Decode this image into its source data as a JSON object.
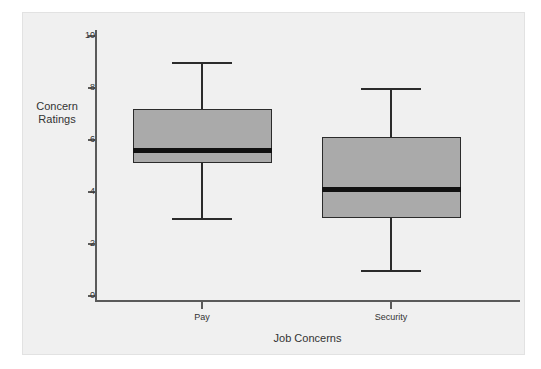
{
  "chart_data": {
    "type": "box",
    "title": "",
    "xlabel": "Job Concerns",
    "ylabel": "Concern Ratings",
    "ylabel_line1": "Concern",
    "ylabel_line2": "Ratings",
    "ylim": [
      0,
      10
    ],
    "yticks": [
      0,
      2,
      4,
      6,
      8,
      10
    ],
    "ytick_labels": [
      "0",
      "2",
      "4",
      "6",
      "8",
      "10"
    ],
    "grid": false,
    "legend": "none",
    "categories": [
      "Pay",
      "Security"
    ],
    "boxes": [
      {
        "label": "Pay",
        "min": 3.0,
        "q1": 5.1,
        "median": 5.6,
        "q3": 7.2,
        "max": 9.0,
        "fill": "#aaaaaa",
        "stroke": "#2b2b2b"
      },
      {
        "label": "Security",
        "min": 1.0,
        "q1": 3.0,
        "median": 4.1,
        "q3": 6.1,
        "max": 8.0,
        "fill": "#aaaaaa",
        "stroke": "#2b2b2b"
      }
    ]
  },
  "style": {
    "panel_background": "#f0f0f0",
    "page_background": "#ffffff",
    "axis_color": "#5a5a5a",
    "text_color": "#333333",
    "median_color": "#111111"
  }
}
